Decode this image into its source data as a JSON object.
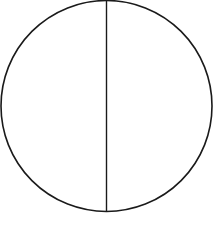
{
  "diagram": {
    "type": "circle-with-diameter",
    "circle": {
      "cx": 106.5,
      "cy": 106,
      "r": 105.5,
      "stroke": "#1a1a1a",
      "stroke_width": 1.6,
      "fill": "none"
    },
    "diameter": {
      "x1": 106.5,
      "y1": 0.5,
      "x2": 106.5,
      "y2": 211.5,
      "stroke": "#1a1a1a",
      "stroke_width": 1.4,
      "orientation": "vertical"
    }
  }
}
